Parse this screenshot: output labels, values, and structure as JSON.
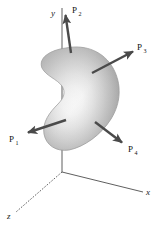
{
  "figure": {
    "background_color": "#ffffff",
    "line_color": "#3a3a3a",
    "arrow_color": "#4a4a4a",
    "body": {
      "name": "shaded-blob",
      "description": "kidney-shaped three-dimensional body with smooth shading",
      "fill_light": "#ffffff",
      "fill_mid": "#d8d8d8",
      "fill_dark": "#9a9a9a",
      "outline_color": "#8c8c8c"
    },
    "axes": [
      {
        "id": "y",
        "label": "y",
        "direction": "up",
        "style": "solid",
        "x1": 62,
        "y1": 172,
        "x2": 62,
        "y2": 8
      },
      {
        "id": "x",
        "label": "x",
        "direction": "lower-right",
        "style": "solid",
        "x1": 62,
        "y1": 172,
        "x2": 143,
        "y2": 192
      },
      {
        "id": "z",
        "label": "z",
        "direction": "lower-left",
        "style": "dashed",
        "x1": 62,
        "y1": 172,
        "x2": 16,
        "y2": 212
      }
    ],
    "origin": {
      "x": 62,
      "y": 172
    },
    "forces": [
      {
        "id": "P1",
        "label": "P",
        "subscript": "1",
        "label_x": 10,
        "label_y": 140,
        "tail_x": 66,
        "tail_y": 120,
        "head_x": 26,
        "head_y": 133,
        "direction": "left and slightly down"
      },
      {
        "id": "P2",
        "label": "P",
        "subscript": "2",
        "label_x": 73,
        "label_y": 11,
        "tail_x": 71,
        "tail_y": 53,
        "head_x": 65,
        "head_y": 13,
        "direction": "up, slightly tilted left"
      },
      {
        "id": "P3",
        "label": "P",
        "subscript": "3",
        "label_x": 139,
        "label_y": 48,
        "tail_x": 92,
        "tail_y": 73,
        "head_x": 135,
        "head_y": 50,
        "direction": "up and to the right"
      },
      {
        "id": "P4",
        "label": "P",
        "subscript": "4",
        "label_x": 132,
        "label_y": 150,
        "tail_x": 95,
        "tail_y": 122,
        "head_x": 124,
        "head_y": 144,
        "direction": "down and to the right"
      }
    ]
  }
}
